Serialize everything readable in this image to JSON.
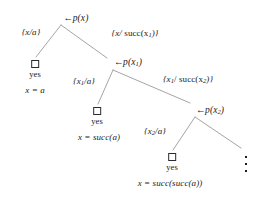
{
  "figure": {
    "kind": "sld-resolution-tree",
    "line_color": "#9a9a9a",
    "text_color": "#1a1a1a",
    "box_color": "#2b2b2b",
    "background": "#ffffff"
  },
  "nodes": {
    "root": {
      "arrow": "←",
      "goal": "p(x)"
    },
    "level1": {
      "arrow": "←",
      "goal_head": "p(x",
      "goal_sub": "1",
      "goal_tail": ")"
    },
    "level2": {
      "arrow": "←",
      "goal_head": "p(x",
      "goal_sub": "2",
      "goal_tail": ")"
    }
  },
  "edge_labels": {
    "l0_left": {
      "text": "{x/a}"
    },
    "l0_right": {
      "prefix": "{x/ ",
      "func": "succ(x",
      "sub": "1",
      "suffix": ")}"
    },
    "l1_left": {
      "prefix": "{x",
      "sub": "1",
      "suffix": "/a}"
    },
    "l1_right": {
      "prefix": "{x",
      "sub1": "1",
      "mid": "/ succ(x",
      "sub2": "2",
      "suffix": ")}"
    },
    "l2_left": {
      "prefix": "{x",
      "sub": "2",
      "suffix": "/a}"
    }
  },
  "leaves": {
    "leaf1": {
      "box": "empty-clause",
      "status": "yes",
      "answer": "x = a"
    },
    "leaf2": {
      "box": "empty-clause",
      "status": "yes",
      "answer": "x = succ(a)"
    },
    "leaf3": {
      "box": "empty-clause",
      "status": "yes",
      "answer": "x = succ(succ(a))"
    }
  },
  "continuation": {
    "symbol": "vertical-dots",
    "dot_count": 3
  }
}
